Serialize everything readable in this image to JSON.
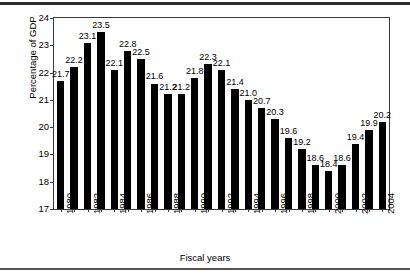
{
  "chart_data": {
    "type": "bar",
    "title": "",
    "xlabel": "Fiscal years",
    "ylabel": "Percentage of GDP",
    "categories": [
      "1980",
      "1981",
      "1982",
      "1983",
      "1984",
      "1985",
      "1986",
      "1987",
      "1988",
      "1989",
      "1990",
      "1991",
      "1992",
      "1993",
      "1994",
      "1995",
      "1996",
      "1997",
      "1998",
      "1999",
      "2000",
      "2001",
      "2002",
      "2003",
      "2004"
    ],
    "values": [
      21.7,
      22.2,
      23.1,
      23.5,
      22.1,
      22.8,
      22.5,
      21.6,
      21.2,
      21.2,
      21.8,
      22.3,
      22.1,
      21.4,
      21.0,
      20.7,
      20.3,
      19.6,
      19.2,
      18.6,
      18.4,
      18.6,
      19.4,
      19.9,
      20.2
    ],
    "value_labels": [
      "21.7",
      "22.2",
      "23.1",
      "23.5",
      "22.1",
      "22.8",
      "22.5",
      "21.6",
      "21.2",
      "21.2",
      "21.8",
      "22.3",
      "22.1",
      "21.4",
      "21.0",
      "20.7",
      "20.3",
      "19.6",
      "19.2",
      "18.6",
      "18.4",
      "18.6",
      "19.4",
      "19.9",
      "20.2"
    ],
    "tick_labels_shown": [
      "1980",
      "1982",
      "1984",
      "1986",
      "1988",
      "1990",
      "1992",
      "1994",
      "1996",
      "1998",
      "2000",
      "2002",
      "2004"
    ],
    "yticks": [
      17,
      18,
      19,
      20,
      21,
      22,
      23,
      24
    ],
    "ytick_labels": [
      "17",
      "18",
      "19",
      "20",
      "21",
      "22",
      "23",
      "24"
    ],
    "ylim": [
      17,
      24
    ],
    "grid": false,
    "legend": null,
    "bar_color": "#000000",
    "frame_color": "#3a3a3a"
  }
}
